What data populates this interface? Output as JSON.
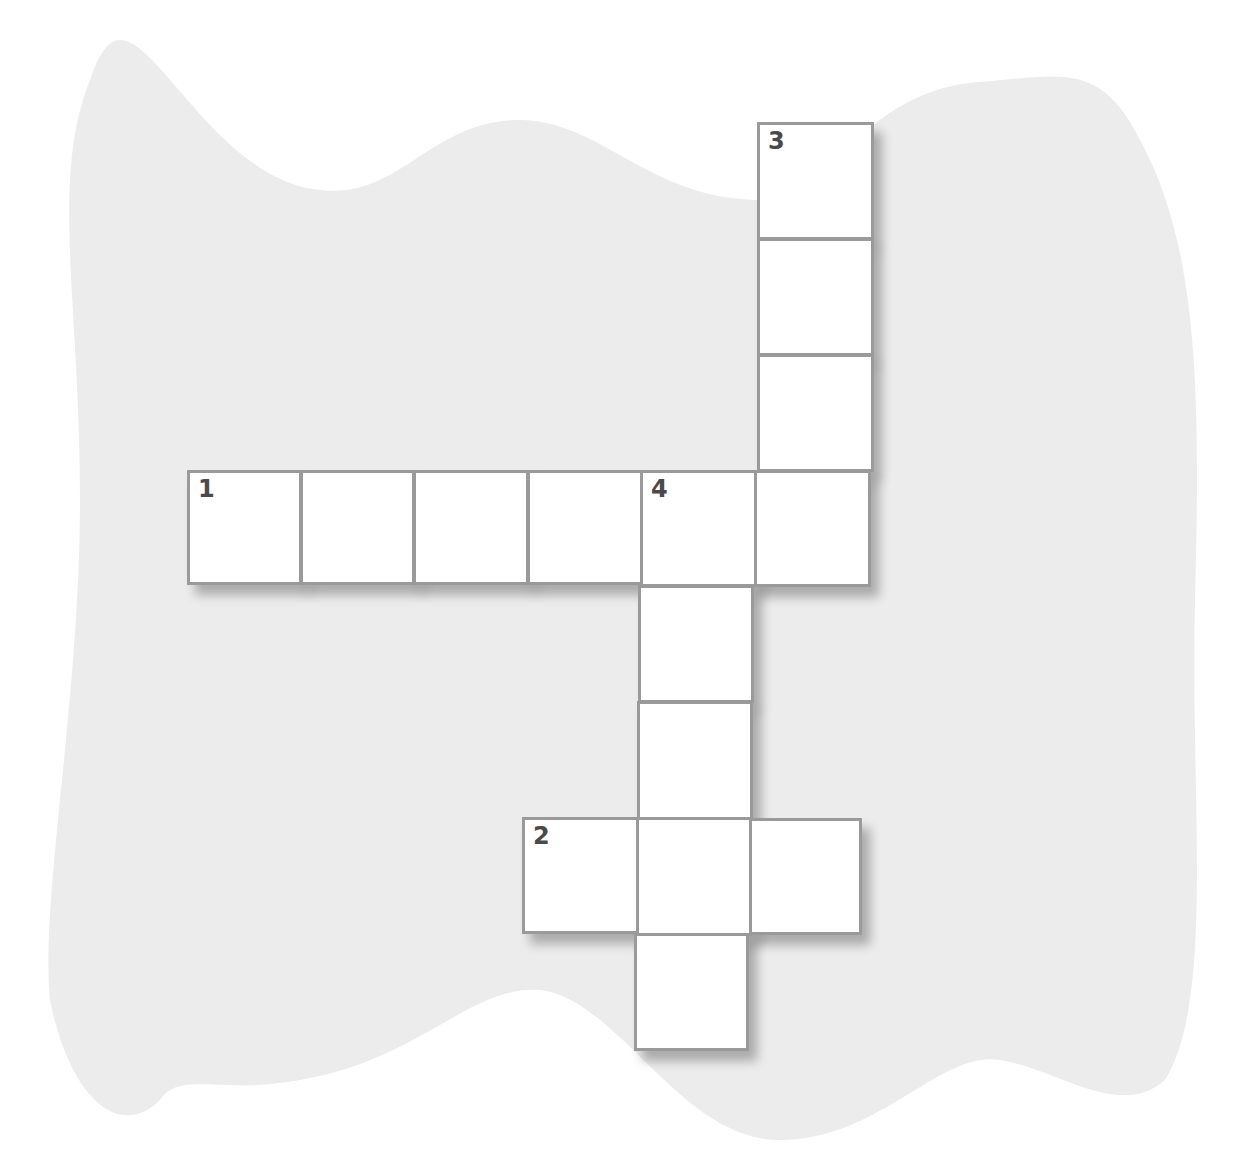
{
  "puzzle": {
    "type": "crossword",
    "background_color": "#ececec",
    "cell_border_color": "#9a9a9a",
    "number_color": "#4a4a4a",
    "cell_size": 116,
    "words": [
      {
        "number": "1",
        "direction": "across",
        "length": 6
      },
      {
        "number": "2",
        "direction": "across",
        "length": 3
      },
      {
        "number": "3",
        "direction": "down",
        "length": 4
      },
      {
        "number": "4",
        "direction": "down",
        "length": 5
      }
    ],
    "cells": [
      {
        "id": "c3-1",
        "x": 757,
        "y": 122,
        "label": "3"
      },
      {
        "id": "c3-2",
        "x": 757,
        "y": 238,
        "label": ""
      },
      {
        "id": "c3-3",
        "x": 757,
        "y": 354,
        "label": ""
      },
      {
        "id": "c1-1",
        "x": 187,
        "y": 470,
        "label": "1"
      },
      {
        "id": "c1-2",
        "x": 300,
        "y": 470,
        "label": ""
      },
      {
        "id": "c1-3",
        "x": 413,
        "y": 470,
        "label": ""
      },
      {
        "id": "c1-4",
        "x": 527,
        "y": 470,
        "label": ""
      },
      {
        "id": "c1-5",
        "x": 640,
        "y": 470,
        "label": "4"
      },
      {
        "id": "c1-6",
        "x": 754,
        "y": 470,
        "label": ""
      },
      {
        "id": "c4-2",
        "x": 638,
        "y": 585,
        "label": ""
      },
      {
        "id": "c4-3",
        "x": 637,
        "y": 701,
        "label": ""
      },
      {
        "id": "c2-1",
        "x": 522,
        "y": 817,
        "label": "2"
      },
      {
        "id": "c2-2",
        "x": 636,
        "y": 817,
        "label": ""
      },
      {
        "id": "c2-3",
        "x": 749,
        "y": 818,
        "label": ""
      },
      {
        "id": "c4-5",
        "x": 634,
        "y": 933,
        "label": ""
      }
    ]
  }
}
